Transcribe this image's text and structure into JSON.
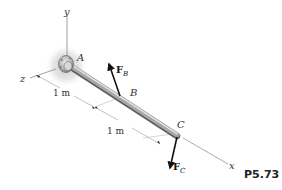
{
  "figure": {
    "problem_label": "P5.73",
    "axes": {
      "x": "x",
      "y": "y",
      "z": "z"
    },
    "points": {
      "A": "A",
      "B": "B",
      "C": "C"
    },
    "forces": [
      {
        "symbol": "F",
        "subscript": "B",
        "applied_at": "B",
        "direction": "up-left"
      },
      {
        "symbol": "F",
        "subscript": "C",
        "applied_at": "C",
        "direction": "down"
      }
    ],
    "dimensions": [
      {
        "label": "1 m",
        "segment": "A-B"
      },
      {
        "label": "1 m",
        "segment": "B-C"
      }
    ],
    "colors": {
      "rod": "#a9a9a9",
      "rod_highlight": "#e2e2e2",
      "rod_shadow": "#6d6d6d",
      "support_glow": "#c8c8c8",
      "arrow": "#111111",
      "axis_line": "#888888"
    }
  }
}
